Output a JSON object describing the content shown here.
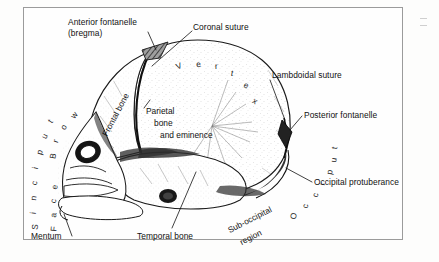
{
  "figure": {
    "view": "lateral (side) view of fetal skull",
    "frame_color": "#9b9b9b",
    "background_color": "#fefefe",
    "ink_color": "#1a1a1a"
  },
  "labels": {
    "anterior_fontanelle_line1": "Anterior fontanelle",
    "anterior_fontanelle_line2": "(bregma)",
    "coronal_suture": "Coronal suture",
    "lambdoidal_suture": "Lambdoidal suture",
    "posterior_fontanelle": "Posterior fontanelle",
    "occipital_protuberance": "Occipital protuberance",
    "temporal_bone": "Temporal bone",
    "mentum": "Mentum",
    "frontal_bone": "Frontal bone",
    "parietal_line1": "Parietal",
    "parietal_line2": "bone",
    "parietal_line3": "and eminence",
    "sub_occipital_line1": "Sub-occipital",
    "sub_occipital_line2": "region"
  },
  "region_arcs": {
    "vertex": "Vertex",
    "occiput": "Occiput",
    "sinciput": "Sinciput",
    "brow": "Brow",
    "face": "Face"
  },
  "arc_glyphs": {
    "vertex": [
      "V",
      "e",
      "r",
      "t",
      "e",
      "x"
    ],
    "occiput": [
      "O",
      "c",
      "c",
      "i",
      "p",
      "u",
      "t"
    ],
    "sinciput": [
      "S",
      "i",
      "n",
      "c",
      "i",
      "p",
      "u",
      "t"
    ],
    "brow": [
      "B",
      "r",
      "o",
      "w"
    ],
    "face": [
      "F",
      "a",
      "c",
      "e"
    ]
  }
}
